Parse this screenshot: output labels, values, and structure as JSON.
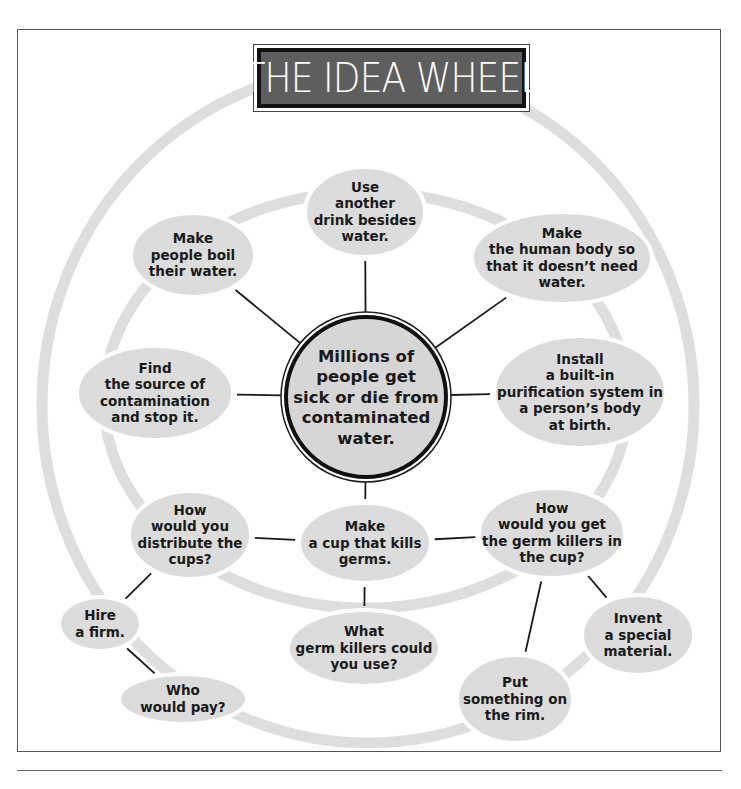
{
  "title": "THE IDEA WHEEL",
  "colors": {
    "bubble_fill": "#dcdcdc",
    "ring": "#dedede",
    "line": "#1a1a1a",
    "title_bg": "#5e5e5e",
    "title_text": "#ffffff"
  },
  "center": {
    "lines": [
      "Millions of",
      "people get",
      "sick or die from",
      "contaminated",
      "water."
    ]
  },
  "nodes": [
    {
      "id": "use-another-drink",
      "lines": [
        "Use",
        "another",
        "drink besides",
        "water."
      ]
    },
    {
      "id": "boil-water",
      "lines": [
        "Make",
        "people boil",
        "their water."
      ]
    },
    {
      "id": "human-body",
      "lines": [
        "Make",
        "the human body so",
        "that it doesn’t need",
        "water."
      ]
    },
    {
      "id": "find-source",
      "lines": [
        "Find",
        "the source of",
        "contamination",
        "and stop it."
      ]
    },
    {
      "id": "install-purification",
      "lines": [
        "Install",
        "a built-in",
        "purification system in",
        "a person’s body",
        "at birth."
      ]
    },
    {
      "id": "distribute-cups",
      "lines": [
        "How",
        "would you",
        "distribute the",
        "cups?"
      ]
    },
    {
      "id": "make-cup",
      "lines": [
        "Make",
        "a cup that kills",
        "germs."
      ]
    },
    {
      "id": "get-germ-killers",
      "lines": [
        "How",
        "would you get",
        "the germ killers in",
        "the cup?"
      ]
    },
    {
      "id": "hire-firm",
      "lines": [
        "Hire",
        "a firm."
      ]
    },
    {
      "id": "what-germ-killers",
      "lines": [
        "What",
        "germ killers could",
        "you use?"
      ]
    },
    {
      "id": "who-would-pay",
      "lines": [
        "Who",
        "would pay?"
      ]
    },
    {
      "id": "invent-material",
      "lines": [
        "Invent",
        "a special",
        "material."
      ]
    },
    {
      "id": "put-on-rim",
      "lines": [
        "Put",
        "something on",
        "the rim."
      ]
    }
  ],
  "connections": [
    [
      "center",
      "use-another-drink"
    ],
    [
      "center",
      "boil-water"
    ],
    [
      "center",
      "human-body"
    ],
    [
      "center",
      "find-source"
    ],
    [
      "center",
      "install-purification"
    ],
    [
      "center",
      "make-cup"
    ],
    [
      "make-cup",
      "distribute-cups"
    ],
    [
      "make-cup",
      "get-germ-killers"
    ],
    [
      "make-cup",
      "what-germ-killers"
    ],
    [
      "distribute-cups",
      "hire-firm"
    ],
    [
      "hire-firm",
      "who-would-pay"
    ],
    [
      "get-germ-killers",
      "invent-material"
    ],
    [
      "get-germ-killers",
      "put-on-rim"
    ]
  ]
}
